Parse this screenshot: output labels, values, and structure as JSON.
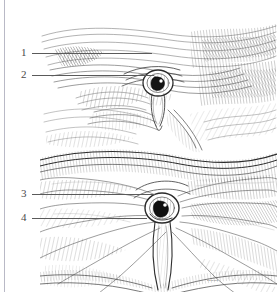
{
  "plate": {
    "title": "Anatomical engraving plate — inguinal region, numbered structures",
    "medium": "pen-and-ink hatched line engraving",
    "background_color": "#ffffff",
    "ink_color": "#3a3a3a",
    "label_color": "#4a4a4a",
    "leader_color": "#5a5a5a",
    "page_rule_color": "#b9b9c6"
  },
  "callouts": [
    {
      "id": "callout-1",
      "number": "1",
      "num_left": 21,
      "num_top": 47,
      "leader_left": 32,
      "leader_top": 53,
      "leader_width": 120
    },
    {
      "id": "callout-2",
      "number": "2",
      "num_left": 21,
      "num_top": 69,
      "leader_left": 32,
      "leader_top": 75,
      "leader_width": 122
    },
    {
      "id": "callout-3",
      "number": "3",
      "num_left": 21,
      "num_top": 188,
      "leader_left": 32,
      "leader_top": 194,
      "leader_width": 123
    },
    {
      "id": "callout-4",
      "number": "4",
      "num_left": 21,
      "num_top": 212,
      "leader_left": 32,
      "leader_top": 218,
      "leader_width": 115
    }
  ],
  "signature": {
    "text": "Artist signature",
    "left": 207,
    "top": 278
  }
}
